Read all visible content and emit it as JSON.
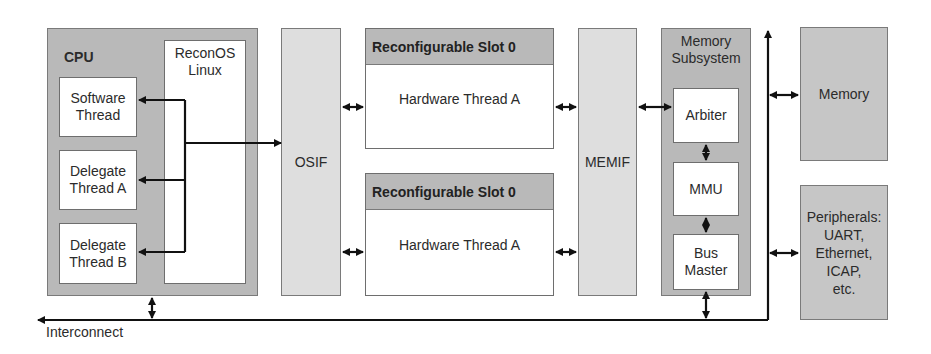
{
  "cpu": {
    "title": "CPU",
    "linux_label_line1": "ReconOS",
    "linux_label_line2": "Linux",
    "threads": [
      {
        "line1": "Software",
        "line2": "Thread"
      },
      {
        "line1": "Delegate",
        "line2": "Thread A"
      },
      {
        "line1": "Delegate",
        "line2": "Thread B"
      }
    ]
  },
  "osif": {
    "label": "OSIF"
  },
  "slots": [
    {
      "header": "Reconfigurable Slot 0",
      "thread": "Hardware Thread A"
    },
    {
      "header": "Reconfigurable Slot 0",
      "thread": "Hardware Thread A"
    }
  ],
  "memif": {
    "label": "MEMIF"
  },
  "memory_subsystem": {
    "title_line1": "Memory",
    "title_line2": "Subsystem",
    "components": [
      {
        "line1": "Arbiter",
        "line2": ""
      },
      {
        "line1": "MMU",
        "line2": ""
      },
      {
        "line1": "Bus",
        "line2": "Master"
      }
    ]
  },
  "memory": {
    "label": "Memory"
  },
  "peripherals": {
    "lines": [
      "Peripherals:",
      "UART,",
      "Ethernet,",
      "ICAP,",
      "etc."
    ]
  },
  "interconnect": {
    "label": "Interconnect"
  },
  "colors": {
    "dark_block": "#b9b9b9",
    "light_block": "#dedede",
    "white_block": "#ffffff",
    "line": "#111111"
  }
}
